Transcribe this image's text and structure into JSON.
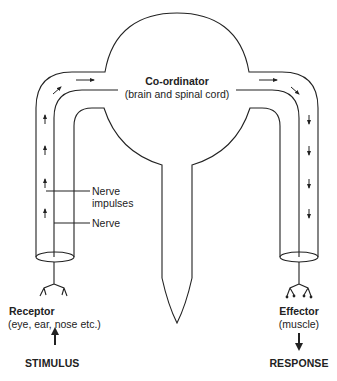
{
  "diagram": {
    "coordinator": {
      "title": "Co-ordinator",
      "subtitle": "(brain and spinal cord)"
    },
    "annotations": {
      "nerve_impulses_line1": "Nerve",
      "nerve_impulses_line2": "impulses",
      "nerve": "Nerve"
    },
    "receptor": {
      "title": "Receptor",
      "subtitle": "(eye, ear, nose etc.)",
      "input": "STIMULUS"
    },
    "effector": {
      "title": "Effector",
      "subtitle": "(muscle)",
      "output": "RESPONSE"
    },
    "colors": {
      "stroke": "#222222",
      "background": "#ffffff"
    }
  }
}
